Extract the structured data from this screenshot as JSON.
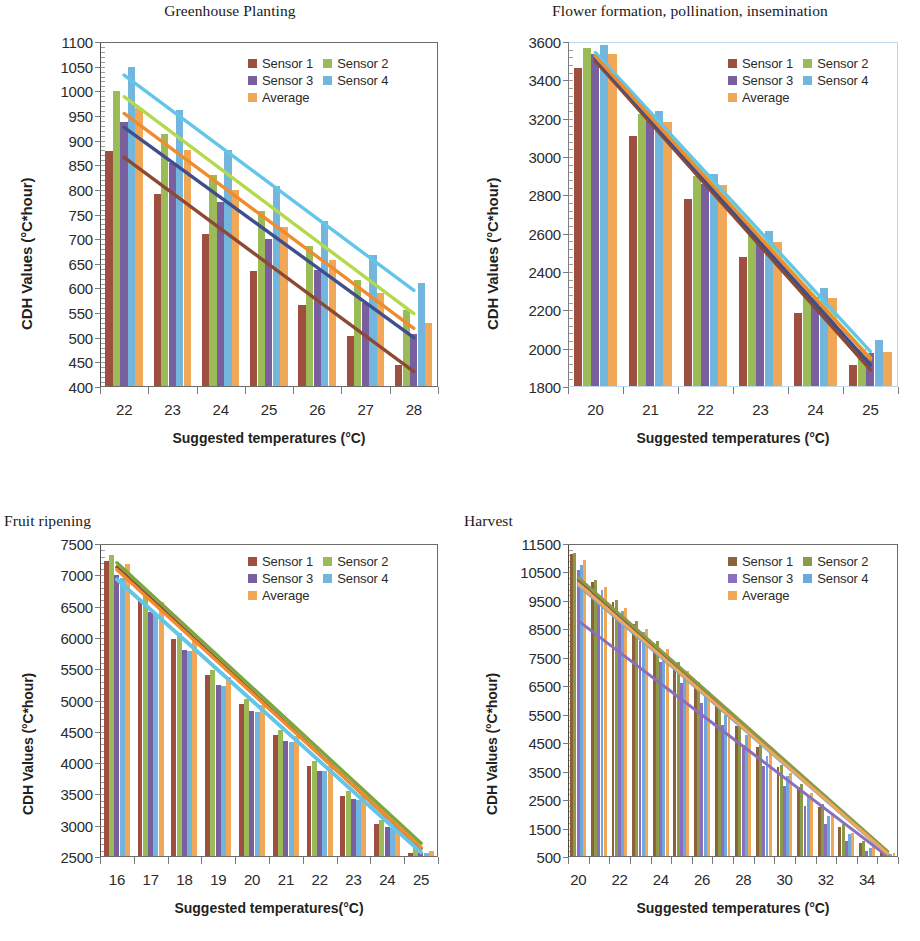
{
  "figure": {
    "legend_labels": [
      "Sensor 1",
      "Sensor 2",
      "Sensor 3",
      "Sensor 4",
      "Average"
    ],
    "colors": {
      "sensor1": "#9e4f3f",
      "sensor2": "#9bbb59",
      "sensor3": "#7a5f9e",
      "sensor4": "#73b6dd",
      "average": "#f0a858",
      "sensor1_dark": "#8c6239",
      "sensor2_olive": "#8a9a48",
      "sensor3_violet": "#8b6fbf",
      "sensor4_blue": "#6fa8dc",
      "trend_sensor1": "#8c4a33",
      "trend_sensor2": "#b4d94c",
      "trend_sensor3": "#3f4e8c",
      "trend_sensor4": "#63c6e8",
      "trend_average": "#f08c2e"
    }
  },
  "charts": [
    {
      "id": "greenhouse-planting",
      "title": "Greenhouse Planting",
      "title_align": "center",
      "xlabel": "Suggested temperatures (°C)",
      "ylabel": "CDH Values  (°C*hour)",
      "chart_data": {
        "type": "bar",
        "title": "Greenhouse Planting",
        "xlabel": "Suggested temperatures (°C)",
        "ylabel": "CDH Values  (°C*hour)",
        "categories": [
          "22",
          "23",
          "24",
          "25",
          "26",
          "27",
          "28"
        ],
        "ylim": [
          400,
          1100
        ],
        "ytick_step": 50,
        "yticks": [
          400,
          450,
          500,
          550,
          600,
          650,
          700,
          750,
          800,
          850,
          900,
          950,
          1000,
          1050,
          1100
        ],
        "grid": false,
        "legend_position": "top-right",
        "series": [
          {
            "name": "Sensor 1",
            "values": [
              878,
              791,
              710,
              636,
              566,
              503,
              445
            ]
          },
          {
            "name": "Sensor 2",
            "values": [
              1001,
              913,
              830,
              757,
              687,
              617,
              556
            ]
          },
          {
            "name": "Sensor 3",
            "values": [
              938,
              855,
              775,
              700,
              638,
              570,
              508
            ]
          },
          {
            "name": "Sensor 4",
            "values": [
              1050,
              962,
              881,
              808,
              737,
              668,
              611
            ]
          },
          {
            "name": "Average",
            "values": [
              967,
              880,
              799,
              725,
              657,
              590,
              530
            ]
          }
        ],
        "trendlines": [
          {
            "name": "Sensor 1",
            "y0": 866,
            "y1": 431
          },
          {
            "name": "Sensor 2",
            "y0": 989,
            "y1": 549
          },
          {
            "name": "Sensor 3",
            "y0": 927,
            "y1": 500
          },
          {
            "name": "Sensor 4",
            "y0": 1033,
            "y1": 596
          },
          {
            "name": "Average",
            "y0": 955,
            "y1": 519
          }
        ]
      }
    },
    {
      "id": "flower-formation",
      "title": "Flower formation, pollination, insemination",
      "title_align": "center",
      "xlabel": "Suggested temperatures (°C)",
      "ylabel": "CDH Values (°C*hour)",
      "chart_data": {
        "type": "bar",
        "title": "Flower formation, pollination, insemination",
        "xlabel": "Suggested temperatures (°C)",
        "ylabel": "CDH Values (°C*hour)",
        "categories": [
          "20",
          "21",
          "22",
          "23",
          "24",
          "25"
        ],
        "ylim": [
          1800,
          3600
        ],
        "ytick_step": 200,
        "yticks": [
          1800,
          2000,
          2200,
          2400,
          2600,
          2800,
          3000,
          3200,
          3400,
          3600
        ],
        "grid": false,
        "legend_position": "top-right",
        "series": [
          {
            "name": "Sensor 1",
            "values": [
              3465,
              3110,
              2782,
              2480,
              2188,
              1915
            ]
          },
          {
            "name": "Sensor 2",
            "values": [
              3570,
              3225,
              2900,
              2600,
              2310,
              2000
            ]
          },
          {
            "name": "Sensor 3",
            "values": [
              3535,
              3190,
              2860,
              2558,
              2268,
              1975
            ]
          },
          {
            "name": "Sensor 4",
            "values": [
              3585,
              3238,
              2912,
              2612,
              2318,
              2045
            ]
          },
          {
            "name": "Average",
            "values": [
              3540,
              3182,
              2855,
              2555,
              2262,
              1985
            ]
          }
        ],
        "trendlines": [
          {
            "name": "Sensor 1",
            "y0": 3500,
            "y1": 1890
          },
          {
            "name": "Sensor 2",
            "y0": 3530,
            "y1": 1950
          },
          {
            "name": "Sensor 3",
            "y0": 3515,
            "y1": 1915
          },
          {
            "name": "Sensor 4",
            "y0": 3545,
            "y1": 1985
          },
          {
            "name": "Average",
            "y0": 3525,
            "y1": 1945
          }
        ]
      }
    },
    {
      "id": "fruit-ripening",
      "title": "Fruit ripening",
      "title_align": "left",
      "xlabel": "Suggested temperatures(°C)",
      "ylabel": "CDH Values (°C*hour)",
      "chart_data": {
        "type": "bar",
        "title": "Fruit ripening",
        "xlabel": "Suggested temperatures(°C)",
        "ylabel": "CDH Values (°C*hour)",
        "categories": [
          "16",
          "17",
          "18",
          "19",
          "20",
          "21",
          "22",
          "23",
          "24",
          "25"
        ],
        "ylim": [
          2500,
          7500
        ],
        "ytick_step": 500,
        "yticks": [
          2500,
          3000,
          3500,
          4000,
          4500,
          5000,
          5500,
          6000,
          6500,
          7000,
          7500
        ],
        "grid": false,
        "legend_position": "top-right",
        "series": [
          {
            "name": "Sensor 1",
            "values": [
              7230,
              6620,
              5990,
              5400,
              4950,
              4450,
              3950,
              3480,
              3020,
              2560
            ]
          },
          {
            "name": "Sensor 2",
            "values": [
              7330,
              6700,
              6080,
              5490,
              5030,
              4530,
              4030,
              3550,
              3090,
              2690
            ]
          },
          {
            "name": "Sensor 3",
            "values": [
              7000,
              6410,
              5810,
              5250,
              4830,
              4350,
              3880,
              3420,
              2980,
              2560
            ]
          },
          {
            "name": "Sensor 4",
            "values": [
              6960,
              6380,
              5790,
              5230,
              4810,
              4340,
              3870,
              3410,
              2970,
              2560
            ]
          },
          {
            "name": "Average",
            "values": [
              7180,
              6580,
              5960,
              5380,
              4930,
              4440,
              3950,
              3480,
              3030,
              2600
            ]
          }
        ],
        "trendlines": [
          {
            "name": "Sensor 1",
            "y0": 7130,
            "y1": 2640
          },
          {
            "name": "Sensor 2",
            "y0": 7200,
            "y1": 2720
          },
          {
            "name": "Sensor 3",
            "y0": 6940,
            "y1": 2580
          },
          {
            "name": "Sensor 4",
            "y0": 6930,
            "y1": 2570
          },
          {
            "name": "Average",
            "y0": 7090,
            "y1": 2650
          }
        ]
      }
    },
    {
      "id": "harvest",
      "title": "Harvest",
      "title_align": "left",
      "xlabel": "Suggested temperatures (°C)",
      "ylabel": "CDH Values (°C*hour)",
      "chart_data": {
        "type": "bar",
        "title": "Harvest",
        "xlabel": "Suggested temperatures (°C)",
        "ylabel": "CDH Values (°C*hour)",
        "categories": [
          "20",
          "21",
          "22",
          "23",
          "24",
          "25",
          "26",
          "27",
          "28",
          "29",
          "30",
          "31",
          "32",
          "33",
          "34",
          "35"
        ],
        "tick_label_step": 2,
        "ylim": [
          500,
          11500
        ],
        "ytick_step": 1000,
        "yticks": [
          500,
          1500,
          2500,
          3500,
          4500,
          5500,
          6500,
          7500,
          8500,
          9500,
          10500,
          11500
        ],
        "grid": false,
        "legend_position": "top-right",
        "series": [
          {
            "name": "Sensor 1",
            "values": [
              11150,
              10150,
              9450,
              8700,
              8000,
              7250,
              6550,
              5800,
              5100,
              4350,
              3650,
              2950,
              2250,
              1550,
              1000,
              700
            ]
          },
          {
            "name": "Sensor 2",
            "values": [
              11200,
              10250,
              9550,
              8800,
              8100,
              7350,
              6650,
              5900,
              5200,
              4450,
              3750,
              3050,
              2350,
              1650,
              1050,
              750
            ]
          },
          {
            "name": "Sensor 3",
            "values": [
              10600,
              9600,
              8850,
              8100,
              7350,
              6600,
              5900,
              5150,
              4450,
              3700,
              3000,
              2300,
              1650,
              1050,
              700,
              560
            ]
          },
          {
            "name": "Sensor 4",
            "values": [
              10750,
              9900,
              9150,
              8400,
              7700,
              6950,
              6250,
              5500,
              4800,
              4050,
              3350,
              2650,
              1950,
              1300,
              800,
              620
            ]
          },
          {
            "name": "Average",
            "values": [
              10950,
              10000,
              9250,
              8500,
              7800,
              7050,
              6350,
              5600,
              4900,
              4150,
              3450,
              2750,
              2050,
              1350,
              880,
              650
            ]
          }
        ],
        "trendlines": [
          {
            "name": "Sensor 1",
            "y0": 10250,
            "y1": 640
          },
          {
            "name": "Sensor 2",
            "y0": 10320,
            "y1": 700
          },
          {
            "name": "Sensor 3",
            "y0": 8800,
            "y1": 520
          },
          {
            "name": "Sensor 4",
            "y0": 10050,
            "y1": 600
          },
          {
            "name": "Average",
            "y0": 10100,
            "y1": 620
          }
        ]
      }
    }
  ]
}
